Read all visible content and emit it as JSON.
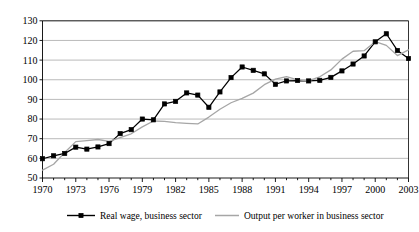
{
  "chart_data": {
    "type": "line",
    "title": "",
    "subtitle": "",
    "xlabel": "",
    "ylabel": "",
    "xlim": [
      1970,
      2003
    ],
    "ylim": [
      50,
      130
    ],
    "ytick_step": 10,
    "xtick_step": 3,
    "grid": "horizontal",
    "legend_position": "bottom",
    "yticks": [
      "130",
      "120",
      "110",
      "100",
      "90",
      "80",
      "70",
      "60",
      "50"
    ],
    "xticks": [
      "1970",
      "1973",
      "1976",
      "1979",
      "1982",
      "1985",
      "1988",
      "1991",
      "1994",
      "1997",
      "2000",
      "2003"
    ],
    "x": [
      1970,
      1971,
      1972,
      1973,
      1974,
      1975,
      1976,
      1977,
      1978,
      1979,
      1980,
      1981,
      1982,
      1983,
      1984,
      1985,
      1986,
      1987,
      1988,
      1989,
      1990,
      1991,
      1992,
      1993,
      1994,
      1995,
      1996,
      1997,
      1998,
      1999,
      2000,
      2001,
      2002,
      2003
    ],
    "series": [
      {
        "name": "Real wage, business sector",
        "color": "#000000",
        "marker": "square",
        "marker_filled": true,
        "values": [
          59.8,
          61.3,
          62.5,
          65.7,
          64.7,
          65.8,
          67.5,
          72.6,
          74.6,
          80.0,
          79.6,
          87.7,
          89.0,
          93.3,
          92.2,
          86.0,
          93.8,
          101.1,
          106.5,
          104.8,
          103.0,
          97.7,
          99.4,
          99.6,
          99.4,
          99.7,
          101.2,
          104.5,
          108.0,
          112.1,
          119.3,
          123.4,
          114.9,
          110.8
        ]
      },
      {
        "name": "Output per worker in business sector",
        "color": "#a6a6a6",
        "marker": "none",
        "marker_filled": false,
        "values": [
          54.0,
          57.0,
          63.0,
          68.5,
          69.0,
          69.6,
          68.6,
          70.6,
          72.5,
          76.0,
          79.0,
          78.8,
          78.2,
          77.8,
          77.5,
          81.0,
          85.0,
          88.3,
          90.5,
          93.2,
          97.5,
          100.3,
          101.6,
          99.9,
          99.5,
          101.5,
          105.0,
          110.5,
          114.5,
          114.8,
          119.4,
          117.5,
          112.3,
          115.2
        ]
      }
    ]
  },
  "legend": {
    "items": [
      {
        "label": "Real wage, business sector",
        "swatch": "line-with-square-marker",
        "color": "#000000"
      },
      {
        "label": "Output per worker in business sector",
        "swatch": "line-gray",
        "color": "#a6a6a6"
      }
    ]
  }
}
